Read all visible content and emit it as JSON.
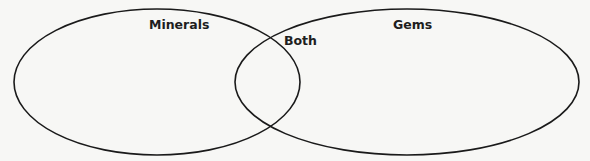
{
  "diagram": {
    "type": "venn",
    "sets": [
      {
        "id": "left",
        "label": "Minerals"
      },
      {
        "id": "right",
        "label": "Gems"
      }
    ],
    "intersection": {
      "label": "Both"
    }
  },
  "colors": {
    "background": "#f7f7f5",
    "stroke": "#1a1a1a",
    "text": "#1e1e1e"
  }
}
